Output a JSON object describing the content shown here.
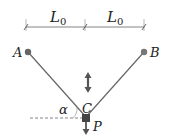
{
  "diagram": {
    "dimension_left": {
      "label": "L",
      "subscript": "0"
    },
    "dimension_right": {
      "label": "L",
      "subscript": "0"
    },
    "points": {
      "A": "A",
      "B": "B",
      "C": "C"
    },
    "angle_label": "α",
    "load_label": "P",
    "colors": {
      "line": "#555555",
      "node": "#666666",
      "mass": "#444444",
      "arrow": "#555555"
    }
  }
}
